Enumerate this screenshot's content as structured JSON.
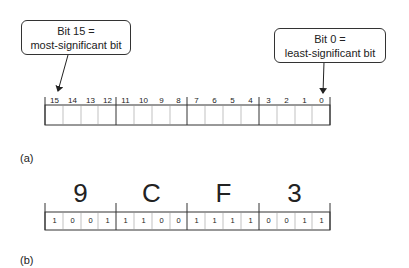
{
  "callouts": {
    "msb": {
      "line1": "Bit 15 =",
      "line2": "most-significant bit"
    },
    "lsb": {
      "line1": "Bit 0 =",
      "line2": "least-significant bit"
    }
  },
  "register_a": {
    "bit_numbers": [
      "15",
      "14",
      "13",
      "12",
      "11",
      "10",
      "9",
      "8",
      "7",
      "6",
      "5",
      "4",
      "3",
      "2",
      "1",
      "0"
    ]
  },
  "register_b": {
    "hex_digits": [
      "9",
      "C",
      "F",
      "3"
    ],
    "bits": [
      "1",
      "0",
      "0",
      "1",
      "1",
      "1",
      "0",
      "0",
      "1",
      "1",
      "1",
      "1",
      "0",
      "0",
      "1",
      "1"
    ]
  },
  "labels": {
    "a": "(a)",
    "b": "(b)"
  }
}
